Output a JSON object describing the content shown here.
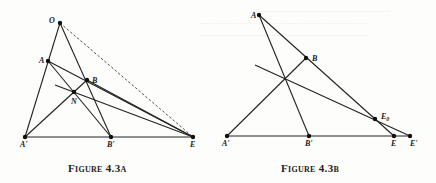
{
  "figures": [
    {
      "caption": "Figure 4.3a",
      "points": {
        "O": {
          "label": "O",
          "x": 60,
          "y": 23
        },
        "A": {
          "label": "A",
          "x": 48,
          "y": 61
        },
        "B": {
          "label": "B",
          "x": 87,
          "y": 80
        },
        "N": {
          "label": "N",
          "x": 74,
          "y": 92
        },
        "A'": {
          "label": "A'",
          "x": 25,
          "y": 137
        },
        "B'": {
          "label": "B'",
          "x": 111,
          "y": 137
        },
        "E": {
          "label": "E",
          "x": 193,
          "y": 137
        }
      }
    },
    {
      "caption": "Figure 4.3b",
      "points": {
        "A": {
          "label": "A",
          "x": 259,
          "y": 15
        },
        "B": {
          "label": "B",
          "x": 306,
          "y": 58
        },
        "A'": {
          "label": "A'",
          "x": 227,
          "y": 136
        },
        "B'": {
          "label": "B'",
          "x": 309,
          "y": 136
        },
        "E0": {
          "label": "E0",
          "x": 375,
          "y": 119
        },
        "E": {
          "label": "E",
          "x": 394,
          "y": 136
        },
        "E'": {
          "label": "E'",
          "x": 410,
          "y": 136
        }
      }
    }
  ],
  "labels": {
    "a_O": "O",
    "a_A": "A",
    "a_B": "B",
    "a_N": "N",
    "a_Ap": "A'",
    "a_Bp": "B'",
    "a_E": "E",
    "b_A": "A",
    "b_B": "B",
    "b_E0": "E",
    "b_E0_sub": "0",
    "b_Ap": "A'",
    "b_Bp": "B'",
    "b_E": "E",
    "b_Ep": "E'"
  },
  "captions": {
    "a": "Figure 4.3a",
    "b": "Figure 4.3b"
  }
}
